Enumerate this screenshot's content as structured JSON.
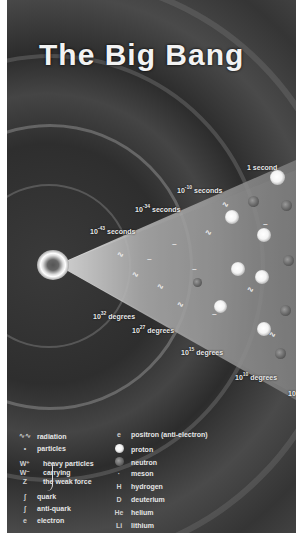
{
  "title": "The Big Bang",
  "time_labels": [
    {
      "base": "1",
      "exp": "",
      "unit": "second"
    },
    {
      "base": "10",
      "exp": "-10",
      "unit": "seconds"
    },
    {
      "base": "10",
      "exp": "-34",
      "unit": "seconds"
    },
    {
      "base": "10",
      "exp": "-43",
      "unit": "seconds"
    }
  ],
  "temperature_labels": [
    {
      "base": "10",
      "exp": "32",
      "unit": "degrees"
    },
    {
      "base": "10",
      "exp": "27",
      "unit": "degrees"
    },
    {
      "base": "10",
      "exp": "15",
      "unit": "degrees"
    },
    {
      "base": "10",
      "exp": "10",
      "unit": "degrees"
    },
    {
      "base": "10",
      "exp": "",
      "unit": ""
    }
  ],
  "legend": {
    "left": [
      {
        "symbol": "∿∿",
        "label": "radiation"
      },
      {
        "symbol": "•",
        "label": "particles"
      },
      {
        "symbol": "W⁺ W⁻ Z",
        "label": "heavy particles carrying the weak force",
        "lines": [
          "heavy particles",
          "carrying",
          "the weak force"
        ]
      },
      {
        "symbol": "ʃ",
        "label": "quark"
      },
      {
        "symbol": "ʃ",
        "label": "anti-quark"
      },
      {
        "symbol": "e",
        "label": "electron"
      }
    ],
    "right": [
      {
        "symbol": "e",
        "label": "positron (anti-electron)"
      },
      {
        "symbol": "●",
        "label": "proton"
      },
      {
        "symbol": "●",
        "label": "neutron"
      },
      {
        "symbol": "·",
        "label": "meson"
      },
      {
        "symbol": "H",
        "label": "hydrogen"
      },
      {
        "symbol": "D",
        "label": "deuterium"
      },
      {
        "symbol": "He",
        "label": "helium"
      },
      {
        "symbol": "Li",
        "label": "lithium"
      }
    ]
  }
}
